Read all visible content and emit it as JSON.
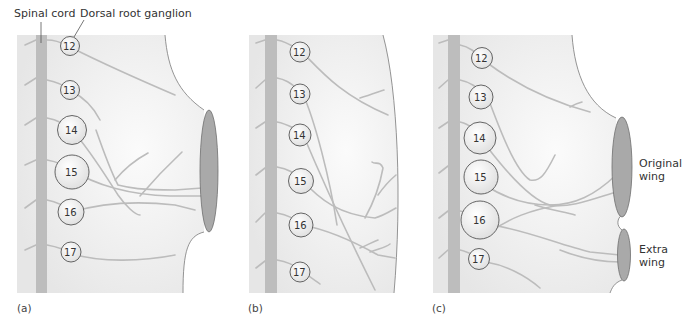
{
  "labels": {
    "spinal_cord": "Spinal cord",
    "dorsal_root_ganglion": "Dorsal root ganglion",
    "original_wing": [
      "Original",
      "wing"
    ],
    "extra_wing": [
      "Extra",
      "wing"
    ]
  },
  "panels": [
    {
      "id": "a",
      "label": "(a)",
      "ganglia": [
        "12",
        "13",
        "14",
        "15",
        "16",
        "17"
      ]
    },
    {
      "id": "b",
      "label": "(b)",
      "ganglia": [
        "12",
        "13",
        "14",
        "15",
        "16",
        "17"
      ]
    },
    {
      "id": "c",
      "label": "(c)",
      "ganglia": [
        "12",
        "13",
        "14",
        "15",
        "16",
        "17"
      ]
    }
  ],
  "colors": {
    "tissue": "#e9e9e9",
    "spinal_cord": "#bdbdbd",
    "nerve": "#bcbcbc",
    "wing": "#a9a9a9",
    "outline": "#7a7a7a",
    "ganglion_fill": "#f4f4f4",
    "ganglion_stroke": "#555555"
  }
}
